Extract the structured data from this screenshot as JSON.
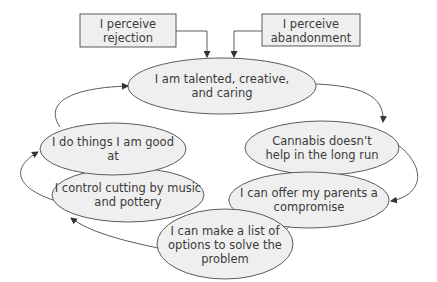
{
  "colors": {
    "fill": "#efefef",
    "stroke": "#4a4a4a",
    "text": "#3a3a3a",
    "background": "#ffffff"
  },
  "boxes": [
    {
      "id": "rejection",
      "lines": [
        "I perceive",
        "rejection"
      ]
    },
    {
      "id": "abandonment",
      "lines": [
        "I perceive",
        "abandonment"
      ]
    }
  ],
  "nodes": [
    {
      "id": "talented",
      "lines": [
        "I am talented, creative,",
        "and caring"
      ]
    },
    {
      "id": "cannabis",
      "lines": [
        "Cannabis doesn’t",
        "help in the long run"
      ]
    },
    {
      "id": "compromise",
      "lines": [
        "I can offer my parents a",
        "compromise"
      ]
    },
    {
      "id": "list",
      "lines": [
        "I can make a list of",
        "options to solve the",
        "problem"
      ]
    },
    {
      "id": "control",
      "lines": [
        "I control cutting by music",
        "and pottery"
      ]
    },
    {
      "id": "good",
      "lines": [
        "I do things I am good",
        "at"
      ]
    }
  ],
  "edges": [
    {
      "from": "rejection",
      "to": "talented"
    },
    {
      "from": "abandonment",
      "to": "talented"
    },
    {
      "from": "talented",
      "to": "cannabis"
    },
    {
      "from": "cannabis",
      "to": "compromise"
    },
    {
      "from": "compromise",
      "to": "list"
    },
    {
      "from": "list",
      "to": "control"
    },
    {
      "from": "control",
      "to": "good"
    },
    {
      "from": "good",
      "to": "talented"
    }
  ]
}
